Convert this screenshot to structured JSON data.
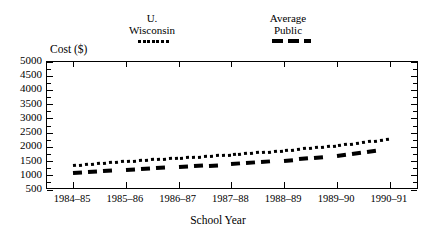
{
  "chart_data": {
    "type": "line",
    "title": "",
    "xlabel": "School Year",
    "ylabel": "Cost ($)",
    "ylim": [
      500,
      5000
    ],
    "ytick_step": 500,
    "grid": false,
    "legend_position": "above-plot",
    "categories": [
      "1984–85",
      "1985–86",
      "1986–87",
      "1987–88",
      "1988–89",
      "1989–90",
      "1990–91"
    ],
    "ytick_labels": [
      "5000",
      "4500",
      "4000",
      "3500",
      "3000",
      "2500",
      "2000",
      "1500",
      "1000",
      "500"
    ],
    "ytick_values": [
      5000,
      4500,
      4000,
      3500,
      3000,
      2500,
      2000,
      1500,
      1000,
      500
    ],
    "series": [
      {
        "name": "U. Wisconsin",
        "legend_line1": "U.",
        "legend_line2": "Wisconsin",
        "style": "dotted",
        "color": "#000000",
        "values": [
          1350,
          1500,
          1620,
          1730,
          1880,
          2060,
          2280
        ]
      },
      {
        "name": "Average Public",
        "legend_line1": "Average",
        "legend_line2": "Public",
        "style": "dashed",
        "color": "#000000",
        "values": [
          1100,
          1200,
          1300,
          1400,
          1530,
          1700,
          1950
        ]
      }
    ]
  },
  "axis": {
    "y_title": "Cost ($)",
    "x_title": "School Year"
  },
  "legend": {
    "items": [
      {
        "line1": "U.",
        "line2": "Wisconsin",
        "style": "dotted"
      },
      {
        "line1": "Average",
        "line2": "Public",
        "style": "dashed"
      }
    ]
  }
}
